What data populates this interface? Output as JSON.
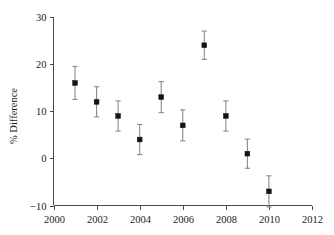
{
  "chart_data": {
    "type": "scatter",
    "title": "",
    "xlabel": "",
    "ylabel": "% Difference",
    "xlim": [
      2000,
      2012
    ],
    "ylim": [
      -10,
      30
    ],
    "xticks": [
      2000,
      2002,
      2004,
      2006,
      2008,
      2010,
      2012
    ],
    "xtick_labels": [
      "2000",
      "2002",
      "2004",
      "2006",
      "2008",
      "2010",
      "2012"
    ],
    "yticks": [
      -10,
      0,
      10,
      20,
      30
    ],
    "ytick_labels": [
      "−10",
      "0",
      "10",
      "20",
      "30"
    ],
    "grid": false,
    "legend": null,
    "x": [
      2001,
      2002,
      2003,
      2004,
      2005,
      2006,
      2007,
      2008,
      2009,
      2010
    ],
    "values": [
      16,
      12,
      9,
      4,
      13,
      7,
      24,
      9,
      1,
      -7
    ],
    "errors": [
      3.5,
      3.2,
      3.2,
      3.2,
      3.3,
      3.3,
      3.0,
      3.2,
      3.1,
      3.3
    ],
    "points": [
      {
        "x": 2001,
        "y": 16,
        "err": 3.5,
        "y_low": 12.5,
        "y_high": 19.5
      },
      {
        "x": 2002,
        "y": 12,
        "err": 3.2,
        "y_low": 8.8,
        "y_high": 15.2
      },
      {
        "x": 2003,
        "y": 9,
        "err": 3.2,
        "y_low": 5.8,
        "y_high": 12.2
      },
      {
        "x": 2004,
        "y": 4,
        "err": 3.2,
        "y_low": 0.8,
        "y_high": 7.2
      },
      {
        "x": 2005,
        "y": 13,
        "err": 3.3,
        "y_low": 9.7,
        "y_high": 16.3
      },
      {
        "x": 2006,
        "y": 7,
        "err": 3.3,
        "y_low": 3.7,
        "y_high": 10.3
      },
      {
        "x": 2007,
        "y": 24,
        "err": 3.0,
        "y_low": 21.0,
        "y_high": 27.0
      },
      {
        "x": 2008,
        "y": 9,
        "err": 3.2,
        "y_low": 5.8,
        "y_high": 12.2
      },
      {
        "x": 2009,
        "y": 1,
        "err": 3.1,
        "y_low": -2.1,
        "y_high": 4.1
      },
      {
        "x": 2010,
        "y": -7,
        "err": 3.3,
        "y_low": -10.3,
        "y_high": -3.7
      }
    ],
    "colors": {
      "marker": "#141414",
      "errorbar": "#8a8a8a",
      "axis": "#4a4a4a",
      "text": "#1a1a1a",
      "background": "#ffffff"
    }
  }
}
